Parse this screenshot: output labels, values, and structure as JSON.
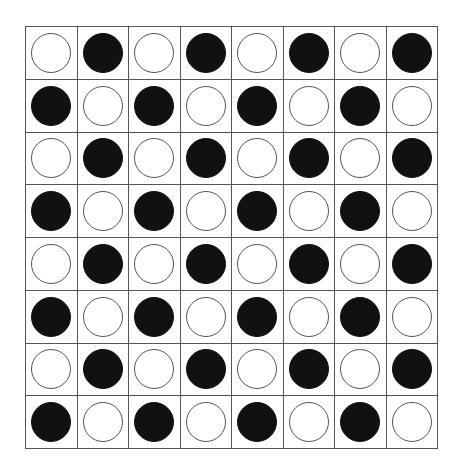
{
  "board": {
    "rows": 8,
    "cols": 8,
    "colors": {
      "line": "#555555",
      "black_piece": "#111111",
      "white_piece": "#ffffff",
      "background": "#ffffff"
    },
    "cells": [
      [
        "white",
        "black",
        "white",
        "black",
        "white",
        "black",
        "white",
        "black"
      ],
      [
        "black",
        "white",
        "black",
        "white",
        "black",
        "white",
        "black",
        "white"
      ],
      [
        "white",
        "black",
        "white",
        "black",
        "white",
        "black",
        "white",
        "black"
      ],
      [
        "black",
        "white",
        "black",
        "white",
        "black",
        "white",
        "black",
        "white"
      ],
      [
        "white",
        "black",
        "white",
        "black",
        "white",
        "black",
        "white",
        "black"
      ],
      [
        "black",
        "white",
        "black",
        "white",
        "black",
        "white",
        "black",
        "white"
      ],
      [
        "white",
        "black",
        "white",
        "black",
        "white",
        "black",
        "white",
        "black"
      ],
      [
        "black",
        "white",
        "black",
        "white",
        "black",
        "white",
        "black",
        "white"
      ]
    ]
  }
}
